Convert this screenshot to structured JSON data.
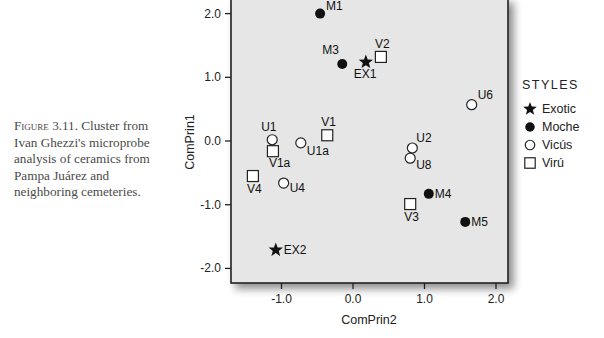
{
  "caption": {
    "figure_label": "Figure 3.11.",
    "text": "Cluster from Ivan Ghezzi's microprobe analysis of ceramics from Pampa Juárez and neighboring cemeteries."
  },
  "chart_data": {
    "type": "scatter",
    "title": "",
    "xlabel": "ComPrin2",
    "ylabel": "ComPrin1",
    "xlim": [
      -1.7,
      2.2
    ],
    "ylim": [
      -2.2,
      2.2
    ],
    "x_ticks": [
      "-1.0",
      "0.0",
      "1.0",
      "2.0"
    ],
    "y_ticks": [
      "2.0",
      "1.0",
      "0.0",
      "-1.0",
      "-2.0"
    ],
    "grid": false,
    "background": "#e6e6e6",
    "legend": {
      "title": "STYLES",
      "position": "right",
      "entries": [
        {
          "name": "Exotic",
          "marker": "star"
        },
        {
          "name": "Moche",
          "marker": "filled-circle"
        },
        {
          "name": "Vicús",
          "marker": "open-circle"
        },
        {
          "name": "Virú",
          "marker": "open-square"
        }
      ]
    },
    "series": [
      {
        "name": "Exotic",
        "marker": "star",
        "points": [
          {
            "label": "EX1",
            "x": 0.18,
            "y": 1.24
          },
          {
            "label": "EX2",
            "x": -1.08,
            "y": -1.71
          }
        ]
      },
      {
        "name": "Moche",
        "marker": "filled-circle",
        "points": [
          {
            "label": "M1",
            "x": -0.46,
            "y": 2.0
          },
          {
            "label": "M3",
            "x": -0.15,
            "y": 1.21
          },
          {
            "label": "M4",
            "x": 1.06,
            "y": -0.83
          },
          {
            "label": "M5",
            "x": 1.57,
            "y": -1.27
          }
        ]
      },
      {
        "name": "Vicús",
        "marker": "open-circle",
        "points": [
          {
            "label": "U6",
            "x": 1.66,
            "y": 0.57
          },
          {
            "label": "U1",
            "x": -1.13,
            "y": 0.02
          },
          {
            "label": "U1a",
            "x": -0.73,
            "y": -0.03
          },
          {
            "label": "U4",
            "x": -0.97,
            "y": -0.66
          },
          {
            "label": "U2",
            "x": 0.83,
            "y": -0.11
          },
          {
            "label": "U8",
            "x": 0.8,
            "y": -0.27
          }
        ]
      },
      {
        "name": "Virú",
        "marker": "open-square",
        "points": [
          {
            "label": "V2",
            "x": 0.39,
            "y": 1.32
          },
          {
            "label": "V1",
            "x": -0.36,
            "y": 0.09
          },
          {
            "label": "V1a",
            "x": -1.12,
            "y": -0.16
          },
          {
            "label": "V4",
            "x": -1.4,
            "y": -0.55
          },
          {
            "label": "V3",
            "x": 0.8,
            "y": -0.99
          }
        ]
      }
    ]
  }
}
